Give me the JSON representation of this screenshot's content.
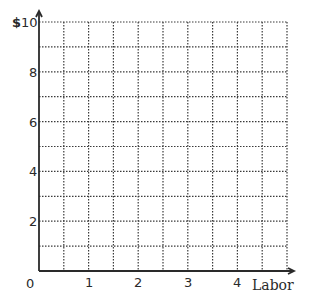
{
  "chart_data": {
    "type": "line",
    "title": "",
    "xlabel": "Labor",
    "ylabel": "$",
    "x_ticks": [
      0,
      1,
      2,
      3,
      4
    ],
    "x_tick_labels": [
      "0",
      "1",
      "2",
      "3",
      "4"
    ],
    "y_ticks": [
      2,
      4,
      6,
      8,
      10
    ],
    "y_tick_labels": [
      "2",
      "4",
      "6",
      "8",
      "$ 10"
    ],
    "xlim": [
      0,
      5
    ],
    "ylim": [
      0,
      10
    ],
    "grid": true,
    "grid_style": "dotted",
    "x_grid_step": 0.5,
    "y_grid_step": 1,
    "series": [],
    "legend": null
  },
  "labels": {
    "origin": "0",
    "x_axis": "Labor",
    "y_currency": "$",
    "x": [
      "1",
      "2",
      "3",
      "4"
    ],
    "y": [
      "2",
      "4",
      "6",
      "8",
      "10"
    ]
  },
  "colors": {
    "axis": "#2a2a2a",
    "grid": "#3a3a3a",
    "background": "#ffffff"
  }
}
